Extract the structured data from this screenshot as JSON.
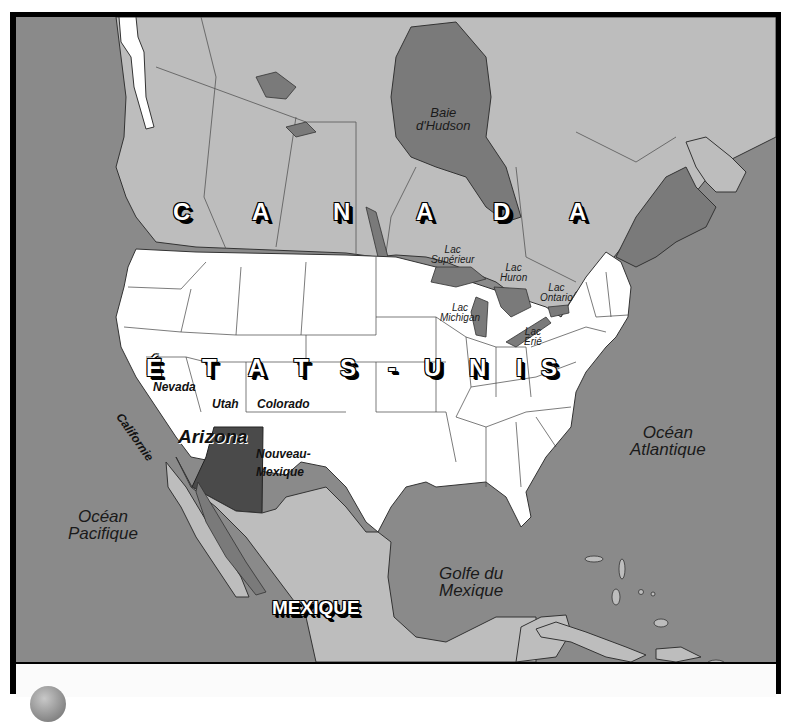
{
  "colors": {
    "ocean": "#8a8a8a",
    "canada_mexico": "#bdbdbd",
    "usa": "#ffffff",
    "lakes_bays": "#7a7a7a",
    "highlight_state": "#4a4a4a",
    "frame": "#000000"
  },
  "countries": {
    "canada": [
      "C",
      "A",
      "N",
      "A",
      "D",
      "A"
    ],
    "usa": [
      "É",
      "T",
      "A",
      "T",
      "S",
      "-",
      "U",
      "N",
      "I",
      "S"
    ],
    "mexico": "MEXIQUE"
  },
  "water_bodies": {
    "hudson": [
      "Baie",
      "d'Hudson"
    ],
    "pacific": [
      "Océan",
      "Pacifique"
    ],
    "atlantic": [
      "Océan",
      "Atlantique"
    ],
    "gulf": [
      "Golfe du",
      "Mexique"
    ]
  },
  "lakes": {
    "superior": [
      "Lac",
      "Supérieur"
    ],
    "huron": [
      "Lac",
      "Huron"
    ],
    "ontario": [
      "Lac",
      "Ontario"
    ],
    "michigan": [
      "Lac",
      "Michigan"
    ],
    "erie": [
      "Lac",
      "Érié"
    ]
  },
  "states": {
    "nevada": "Nevada",
    "utah": "Utah",
    "colorado": "Colorado",
    "california": "Californie",
    "arizona": "Arizona",
    "new_mexico": [
      "Nouveau-",
      "Mexique"
    ]
  },
  "highlighted_state": "Arizona"
}
